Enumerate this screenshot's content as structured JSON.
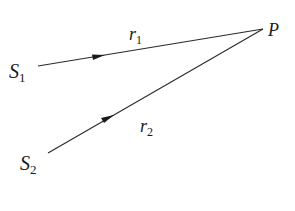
{
  "diagram": {
    "points": {
      "S1": {
        "label": "S",
        "subscript": "1",
        "x": 38,
        "y": 66
      },
      "S2": {
        "label": "S",
        "subscript": "2",
        "x": 48,
        "y": 153
      },
      "P": {
        "label": "P",
        "x": 263,
        "y": 29
      }
    },
    "paths": [
      {
        "name": "r1",
        "label": "r",
        "subscript": "1",
        "from": "S1",
        "to": "P"
      },
      {
        "name": "r2",
        "label": "r",
        "subscript": "2",
        "from": "S2",
        "to": "P"
      }
    ],
    "colors": {
      "line": "#2a2a2a",
      "text": "#1a1a1a",
      "background": "#ffffff"
    }
  }
}
